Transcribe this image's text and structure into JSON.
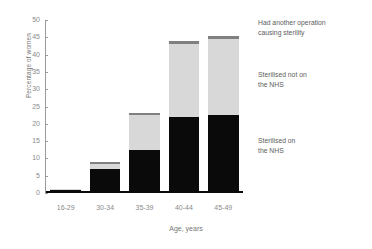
{
  "chart_data": {
    "type": "bar",
    "stacked": true,
    "title": "",
    "xlabel": "Age, years",
    "ylabel": "Percentage of women",
    "categories": [
      "16-29",
      "30-34",
      "35-39",
      "40-44",
      "45-49"
    ],
    "ylim": [
      0,
      50
    ],
    "ytick_step": 5,
    "yticks": [
      "0",
      "5",
      "10",
      "15",
      "20",
      "25",
      "30",
      "35",
      "40",
      "45",
      "50"
    ],
    "grid": false,
    "legend_position": "right",
    "series": [
      {
        "name": "Sterilised on\nthe NHS",
        "color": "#0a0a0a",
        "values": [
          1.0,
          7.0,
          12.5,
          22.0,
          22.5
        ]
      },
      {
        "name": "Sterilised not on\nthe NHS",
        "color": "#d8d8d8",
        "values": [
          0.2,
          1.5,
          10.0,
          21.0,
          22.0
        ]
      },
      {
        "name": "Had another operation\ncausing sterility",
        "color": "#808080",
        "values": [
          0.0,
          0.5,
          0.7,
          0.8,
          1.0
        ]
      }
    ],
    "totals": [
      1.2,
      9.0,
      23.2,
      43.8,
      45.5
    ]
  },
  "axes": {
    "y_title": "Percentage of women",
    "x_title": "Age, years"
  },
  "legend": {
    "items": [
      {
        "label": "Had another operation\ncausing sterility",
        "color": "#808080"
      },
      {
        "label": "Sterilised not on\nthe NHS",
        "color": "#d8d8d8"
      },
      {
        "label": "Sterilised on\nthe NHS",
        "color": "#0a0a0a"
      }
    ]
  }
}
